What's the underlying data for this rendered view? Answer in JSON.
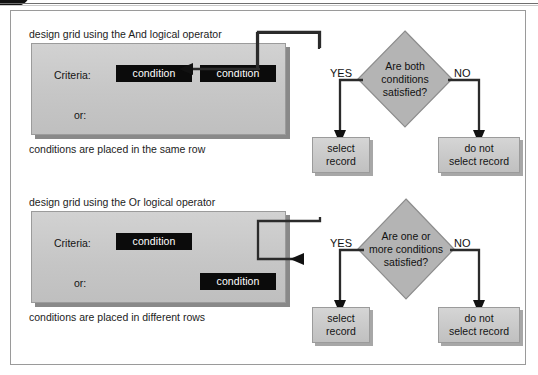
{
  "page": {
    "corner_badge": "",
    "header_strip": ""
  },
  "figure": {
    "sections": [
      {
        "id": "and-section",
        "caption_top": "design grid using the And logical operator",
        "caption_bottom": "conditions are placed in the same row",
        "grid": {
          "criteria_label": "Criteria:",
          "or_label": "or:",
          "chips": [
            {
              "text": "condition"
            },
            {
              "text": "condition"
            }
          ]
        },
        "decision": {
          "lines": [
            "Are both",
            "conditions",
            "satisfied?"
          ]
        },
        "branches": {
          "yes_label": "YES",
          "no_label": "NO"
        },
        "outcomes": [
          {
            "lines": [
              "select",
              "record"
            ]
          },
          {
            "lines": [
              "do not",
              "select record"
            ]
          }
        ]
      },
      {
        "id": "or-section",
        "caption_top": "design grid using the Or logical operator",
        "caption_bottom": "conditions are placed in different rows",
        "grid": {
          "criteria_label": "Criteria:",
          "or_label": "or:",
          "chips": [
            {
              "text": "condition"
            },
            {
              "text": "condition"
            }
          ]
        },
        "decision": {
          "lines": [
            "Are one or",
            "more conditions",
            "satisfied?"
          ]
        },
        "branches": {
          "yes_label": "YES",
          "no_label": "NO"
        },
        "outcomes": [
          {
            "lines": [
              "select",
              "record"
            ]
          },
          {
            "lines": [
              "do not",
              "select record"
            ]
          }
        ]
      }
    ]
  },
  "colors": {
    "panel_border": "#9a9a9a",
    "grid_fill": "#c8c8c8",
    "chip_fill": "#0b0b0b",
    "diamond_fill": "#b5b5b5",
    "line": "#2b2b2b"
  }
}
